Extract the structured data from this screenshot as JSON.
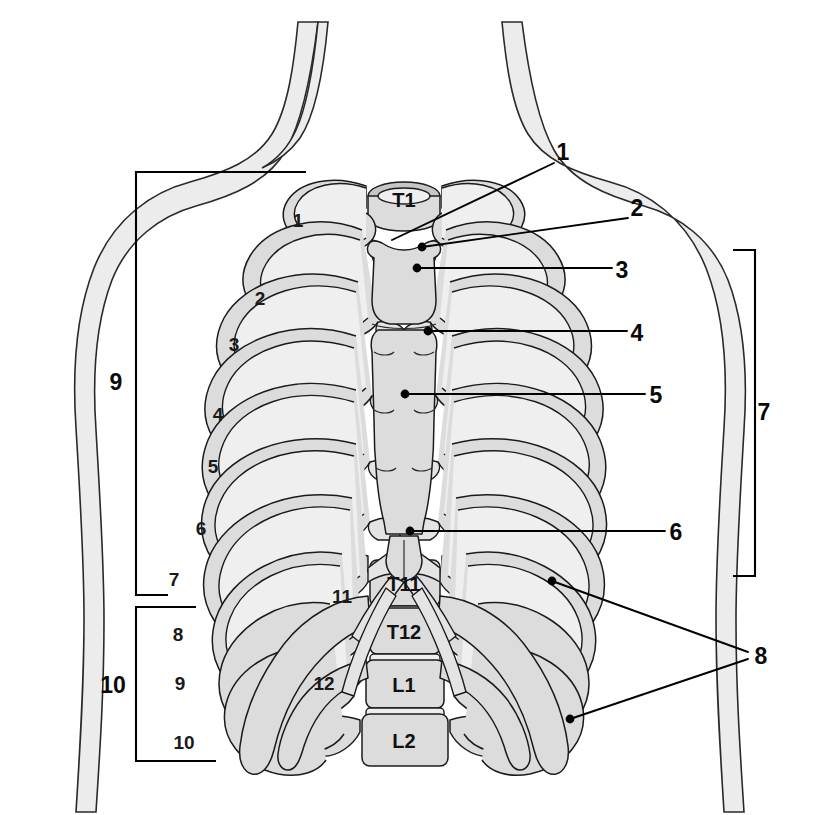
{
  "colors": {
    "bone_fill": "#dcdcdc",
    "bone_fill_light": "#efefef",
    "bone_fill_dark": "#c6c6c6",
    "outline": "#1b1b1b",
    "body_silhouette": "#ececec",
    "label_text": "#0a0a0a",
    "leader_line": "#000000"
  },
  "vertebra_labels": [
    {
      "id": "vert-t1",
      "text": "T1",
      "x": 404,
      "y": 207
    },
    {
      "id": "vert-t11",
      "text": "T11",
      "x": 404,
      "y": 583
    },
    {
      "id": "vert-t12",
      "text": "T12",
      "x": 404,
      "y": 630
    },
    {
      "id": "vert-l1",
      "text": "L1",
      "x": 404,
      "y": 683
    },
    {
      "id": "vert-l2",
      "text": "L2",
      "x": 404,
      "y": 733
    }
  ],
  "rib_number_labels": [
    {
      "id": "rib-1",
      "text": "1",
      "x": 298,
      "y": 227
    },
    {
      "id": "rib-2",
      "text": "2",
      "x": 260,
      "y": 305
    },
    {
      "id": "rib-3",
      "text": "3",
      "x": 234,
      "y": 351
    },
    {
      "id": "rib-4",
      "text": "4",
      "x": 218,
      "y": 421
    },
    {
      "id": "rib-5",
      "text": "5",
      "x": 213,
      "y": 473
    },
    {
      "id": "rib-6",
      "text": "6",
      "x": 201,
      "y": 535
    },
    {
      "id": "rib-7",
      "text": "7",
      "x": 174,
      "y": 586
    },
    {
      "id": "rib-8",
      "text": "8",
      "x": 178,
      "y": 641
    },
    {
      "id": "rib-9",
      "text": "9",
      "x": 180,
      "y": 690
    },
    {
      "id": "rib-10",
      "text": "10",
      "x": 184,
      "y": 749
    },
    {
      "id": "rib-11",
      "text": "11",
      "x": 342,
      "y": 597
    },
    {
      "id": "rib-12",
      "text": "12",
      "x": 324,
      "y": 684
    }
  ],
  "leader_labels": [
    {
      "id": "callout-1",
      "text": "1",
      "x": 563,
      "y": 152
    },
    {
      "id": "callout-2",
      "text": "2",
      "x": 637,
      "y": 207
    },
    {
      "id": "callout-3",
      "text": "3",
      "x": 622,
      "y": 271
    },
    {
      "id": "callout-4",
      "text": "4",
      "x": 637,
      "y": 334
    },
    {
      "id": "callout-5",
      "text": "5",
      "x": 656,
      "y": 396
    },
    {
      "id": "callout-6",
      "text": "6",
      "x": 676,
      "y": 533
    },
    {
      "id": "callout-8",
      "text": "8",
      "x": 761,
      "y": 657
    }
  ],
  "bracket_labels": [
    {
      "id": "bracket-7",
      "text": "7",
      "x": 762,
      "y": 413
    },
    {
      "id": "bracket-9",
      "text": "9",
      "x": 116,
      "y": 383
    },
    {
      "id": "bracket-10",
      "text": "10",
      "x": 113,
      "y": 686
    }
  ],
  "brackets": [
    {
      "id": "bracket-right-7",
      "label": "7",
      "orientation": "right",
      "top": 250,
      "bottom": 576,
      "x": 747
    },
    {
      "id": "bracket-left-9",
      "label": "9",
      "orientation": "left",
      "top": 172,
      "bottom": 595,
      "x": 136
    },
    {
      "id": "bracket-left-10",
      "label": "10",
      "orientation": "left",
      "top": 607,
      "bottom": 761,
      "x": 136
    }
  ],
  "leader_lines": [
    {
      "id": "leader-1",
      "from_x": 554,
      "from_y": 163,
      "to_x": 392,
      "to_y": 240,
      "dot": false
    },
    {
      "id": "leader-2",
      "from_x": 628,
      "from_y": 218,
      "to_x": 422,
      "to_y": 247,
      "dot": true
    },
    {
      "id": "leader-3",
      "from_x": 612,
      "from_y": 268,
      "to_x": 417,
      "to_y": 268,
      "dot": true
    },
    {
      "id": "leader-4",
      "from_x": 627,
      "from_y": 331,
      "to_x": 428,
      "to_y": 331,
      "dot": true
    },
    {
      "id": "leader-5",
      "from_x": 645,
      "from_y": 394,
      "to_x": 405,
      "to_y": 394,
      "dot": true
    },
    {
      "id": "leader-6",
      "from_x": 665,
      "from_y": 531,
      "to_x": 410,
      "to_y": 531,
      "dot": true
    },
    {
      "id": "leader-8a",
      "from_x": 748,
      "from_y": 652,
      "to_x": 552,
      "to_y": 581,
      "dot": true
    },
    {
      "id": "leader-8b",
      "from_x": 748,
      "from_y": 659,
      "to_x": 570,
      "to_y": 719,
      "dot": true
    }
  ]
}
